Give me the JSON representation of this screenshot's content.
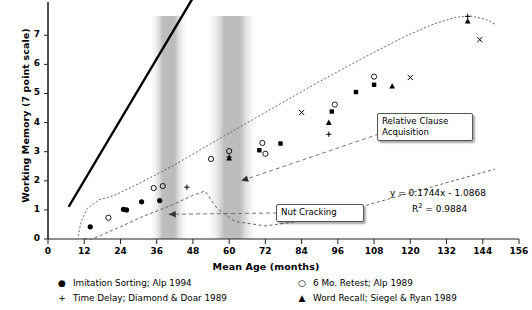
{
  "chart_data": {
    "type": "scatter",
    "title": "",
    "xlabel": "Mean Age (months)",
    "ylabel": "Working Memory (7 point scale)",
    "xlim": [
      0,
      156
    ],
    "ylim": [
      0,
      7.8
    ],
    "xticks": [
      0,
      12,
      24,
      36,
      48,
      60,
      72,
      84,
      96,
      108,
      120,
      132,
      144,
      156
    ],
    "yticks": [
      0,
      1,
      2,
      3,
      4,
      5,
      6,
      7
    ],
    "grid": false,
    "legend_position": "below-axes",
    "series": [
      {
        "name": "Imitation Sorting; Alp 1994",
        "marker": "filled-circle",
        "points": [
          {
            "x": 14,
            "y": 0.42
          },
          {
            "x": 25,
            "y": 1.02
          },
          {
            "x": 26,
            "y": 1.0
          },
          {
            "x": 31,
            "y": 1.28
          },
          {
            "x": 37,
            "y": 1.32
          }
        ]
      },
      {
        "name": "6 Mo. Retest; Alp 1989",
        "marker": "open-circle",
        "points": [
          {
            "x": 20,
            "y": 0.73
          },
          {
            "x": 35,
            "y": 1.75
          },
          {
            "x": 38,
            "y": 1.82
          },
          {
            "x": 54,
            "y": 2.75
          },
          {
            "x": 60,
            "y": 3.02
          },
          {
            "x": 71,
            "y": 3.3
          },
          {
            "x": 72,
            "y": 2.93
          },
          {
            "x": 95,
            "y": 4.62
          },
          {
            "x": 108,
            "y": 5.58
          }
        ]
      },
      {
        "name": "Time Delay; Diamond & Doar 1989",
        "marker": "plus",
        "points": [
          {
            "x": 46,
            "y": 1.78
          },
          {
            "x": 60,
            "y": 2.82
          },
          {
            "x": 93,
            "y": 3.6
          },
          {
            "x": 139,
            "y": 7.65
          }
        ]
      },
      {
        "name": "Word Recall; Siegel & Ryan 1989",
        "marker": "filled-triangle",
        "points": [
          {
            "x": 60,
            "y": 2.78
          },
          {
            "x": 93,
            "y": 4.0
          },
          {
            "x": 114,
            "y": 5.25
          },
          {
            "x": 139,
            "y": 7.48
          }
        ]
      },
      {
        "name": "x-marker-series",
        "marker": "x",
        "points": [
          {
            "x": 84,
            "y": 4.35
          },
          {
            "x": 120,
            "y": 5.55
          },
          {
            "x": 143,
            "y": 6.85
          }
        ]
      },
      {
        "name": "filled-square-series",
        "marker": "filled-square",
        "points": [
          {
            "x": 70,
            "y": 3.05
          },
          {
            "x": 77,
            "y": 3.28
          },
          {
            "x": 94,
            "y": 4.38
          },
          {
            "x": 102,
            "y": 5.05
          },
          {
            "x": 108,
            "y": 5.3
          }
        ]
      }
    ],
    "trendline": {
      "equation": "y = 0.1744x - 1.0868",
      "r_squared_label": "R",
      "r_squared_exp": "2",
      "r_squared_value": " = 0.9884",
      "slope": 0.1744,
      "intercept": -1.0868,
      "r2": 0.9884,
      "x_start": 7,
      "x_end": 150
    },
    "annotations": [
      {
        "label": "Relative Clause\nAcquisition",
        "points_to_x": 64,
        "points_to_y": 2.0
      },
      {
        "label": "Nut Cracking",
        "points_to_x": 40,
        "points_to_y": 0.85
      }
    ],
    "shaded_bands": [
      {
        "x_center": 40,
        "x_width": 6
      },
      {
        "x_center": 61,
        "x_width": 8
      }
    ],
    "envelope_curves": [
      "upper-dotted-curve",
      "lower-dotted-curve"
    ]
  },
  "axes": {
    "x_tick_labels": [
      "0",
      "12",
      "24",
      "36",
      "48",
      "60",
      "72",
      "84",
      "96",
      "108",
      "120",
      "132",
      "144",
      "156"
    ],
    "y_tick_labels": [
      "0",
      "1",
      "2",
      "3",
      "4",
      "5",
      "6",
      "7"
    ],
    "x_title": "Mean Age (months)",
    "y_title": "Working Memory (7 point scale)"
  },
  "legend": {
    "entries": [
      {
        "marker_glyph": "●",
        "label": "Imitation Sorting; Alp 1994"
      },
      {
        "marker_glyph": "+",
        "label": "Time Delay; Diamond & Doar 1989"
      },
      {
        "marker_glyph": "○",
        "label": "6 Mo. Retest; Alp 1989"
      },
      {
        "marker_glyph": "▲",
        "label": "Word Recall; Siegel & Ryan 1989"
      }
    ]
  },
  "callouts": {
    "relative_clause": "Relative Clause\nAcquisition",
    "nut_cracking": "Nut Cracking"
  },
  "equation": {
    "line1": "y = 0.1744x - 1.0868",
    "r_prefix": "R",
    "r_sup": "2",
    "r_suffix": " = 0.9884"
  },
  "colors": {
    "axis": "#222222",
    "trendline": "#000000",
    "envelope": "#555555",
    "band": "#bdbdbd",
    "callout_border": "#555555"
  }
}
